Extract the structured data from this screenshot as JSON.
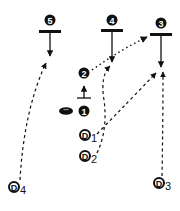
{
  "diagram": {
    "type": "football-play",
    "colors": {
      "ink": "#111111",
      "background": "#ffffff"
    },
    "offense": [
      {
        "id": "1",
        "label": "1",
        "x": 84,
        "y": 111
      },
      {
        "id": "2",
        "label": "2",
        "x": 84,
        "y": 73
      },
      {
        "id": "3",
        "label": "3",
        "x": 161,
        "y": 23
      },
      {
        "id": "4",
        "label": "4",
        "x": 112,
        "y": 20
      },
      {
        "id": "5",
        "label": "5",
        "x": 50,
        "y": 20
      }
    ],
    "defense": [
      {
        "id": "D1",
        "letter": "D",
        "sub": "1",
        "x": 88,
        "y": 136
      },
      {
        "id": "D2",
        "letter": "D",
        "sub": "2",
        "x": 88,
        "y": 157
      },
      {
        "id": "D3",
        "letter": "D",
        "sub": "3",
        "x": 162,
        "y": 184
      },
      {
        "id": "D4",
        "letter": "D",
        "sub": "4",
        "x": 17,
        "y": 188
      }
    ],
    "football": {
      "x": 66,
      "y": 111
    },
    "routes": [
      {
        "from": "5",
        "style": "solid",
        "description": "down arrow below block bar"
      },
      {
        "from": "4",
        "style": "solid",
        "description": "down arrow below block bar"
      },
      {
        "from": "3",
        "style": "solid",
        "description": "down arrow below block bar"
      },
      {
        "from": "2",
        "style": "solid",
        "description": "short up arrow"
      },
      {
        "from": "2",
        "to": "3",
        "style": "dotted",
        "description": "pass to 3"
      },
      {
        "from": "D1",
        "to": "3",
        "style": "dashed"
      },
      {
        "from": "D2",
        "to": "4",
        "style": "dashed"
      },
      {
        "from": "D3",
        "to": "3",
        "style": "dashed"
      },
      {
        "from": "D4",
        "to": "5",
        "style": "dashed"
      }
    ]
  }
}
